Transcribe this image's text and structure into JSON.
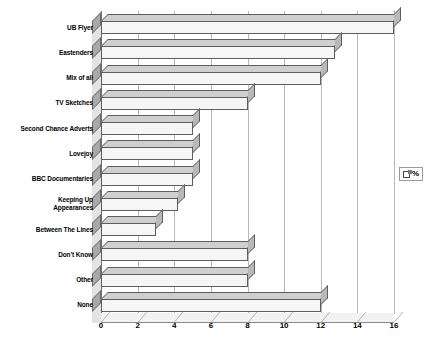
{
  "chart_data": {
    "type": "bar",
    "orientation": "horizontal",
    "title": "",
    "xlabel": "",
    "ylabel": "",
    "xlim": [
      0,
      16
    ],
    "xticks": [
      0,
      2,
      4,
      6,
      8,
      10,
      12,
      14,
      16
    ],
    "grid": true,
    "legend_position": "right",
    "categories": [
      "UB Flyer",
      "Eastenders",
      "Mix of all",
      "TV Sketches",
      "Second Chance Adverts",
      "Lovejoy",
      "BBC Documentaries",
      "Keeping Up Appearances",
      "Between The Lines",
      "Don't Know",
      "Other",
      "None"
    ],
    "series": [
      {
        "name": "%",
        "values": [
          16,
          12.8,
          12,
          8,
          5,
          5,
          5,
          4.2,
          3,
          8,
          8,
          12
        ]
      }
    ]
  },
  "legend": {
    "entries": [
      {
        "label": "%",
        "swatch_color": "#ffffff"
      }
    ]
  },
  "axis": {
    "x_tick_labels": [
      "0",
      "2",
      "4",
      "6",
      "8",
      "10",
      "12",
      "14",
      "16"
    ]
  },
  "colors": {
    "bar_front": "#f6f6f6",
    "bar_top": "#cfcfcf",
    "bar_side": "#b9b9b9",
    "bar_outline": "#5e5e5e",
    "gridline": "#b8b8b8",
    "axis": "#6f6f6f",
    "background": "#ffffff",
    "text": "#000000"
  }
}
